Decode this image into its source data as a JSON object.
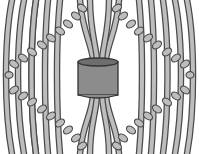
{
  "illustration": {
    "subject": "macrame square-knot pattern around a cylindrical bead",
    "colors": {
      "background": "#ffffff",
      "cord_fill": "#bdbdbd",
      "cord_outline": "#4a4a4a",
      "bead_fill": "#8c8c8c",
      "bead_top": "#6e6e6e"
    }
  }
}
